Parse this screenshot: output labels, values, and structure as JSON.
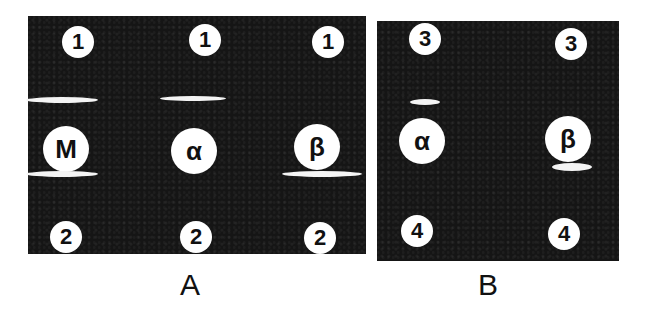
{
  "figure": {
    "panels": [
      {
        "id": "A",
        "label": "A",
        "wells": [
          {
            "name": "well-1-left",
            "label": "1"
          },
          {
            "name": "well-1-center",
            "label": "1"
          },
          {
            "name": "well-1-right",
            "label": "1"
          },
          {
            "name": "well-M",
            "label": "M"
          },
          {
            "name": "well-alpha",
            "label": "α"
          },
          {
            "name": "well-beta",
            "label": "β"
          },
          {
            "name": "well-2-left",
            "label": "2"
          },
          {
            "name": "well-2-center",
            "label": "2"
          },
          {
            "name": "well-2-right",
            "label": "2"
          }
        ]
      },
      {
        "id": "B",
        "label": "B",
        "wells": [
          {
            "name": "well-3-left",
            "label": "3"
          },
          {
            "name": "well-3-right",
            "label": "3"
          },
          {
            "name": "well-alpha",
            "label": "α"
          },
          {
            "name": "well-beta",
            "label": "β"
          },
          {
            "name": "well-4-left",
            "label": "4"
          },
          {
            "name": "well-4-right",
            "label": "4"
          }
        ]
      }
    ],
    "colors": {
      "gel_background": "#151515",
      "wells_and_bands": "#ffffff",
      "page": "#ffffff"
    }
  }
}
